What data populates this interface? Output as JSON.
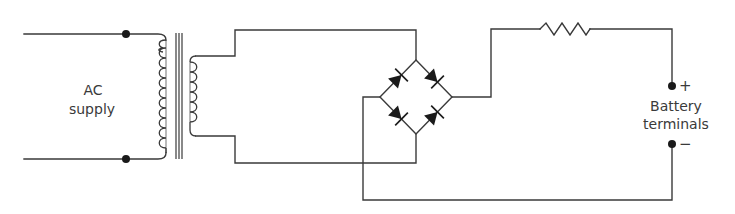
{
  "diagram": {
    "type": "circuit-schematic",
    "labels": {
      "ac_supply_line1": "AC",
      "ac_supply_line2": "supply",
      "battery_line1": "Battery",
      "battery_line2": "terminals",
      "positive": "+",
      "negative": "−"
    },
    "components": [
      {
        "id": "ac-input",
        "kind": "terminals",
        "label": "AC supply"
      },
      {
        "id": "transformer",
        "kind": "transformer",
        "primary_turns_drawn": 11,
        "secondary_turns_drawn": 7,
        "core_lines": 3
      },
      {
        "id": "bridge",
        "kind": "bridge-rectifier",
        "diodes": 4
      },
      {
        "id": "resistor",
        "kind": "resistor"
      },
      {
        "id": "battery",
        "kind": "terminals",
        "label": "Battery terminals"
      }
    ],
    "colors": {
      "ink": "#3a3a3a",
      "background": "#ffffff"
    }
  }
}
